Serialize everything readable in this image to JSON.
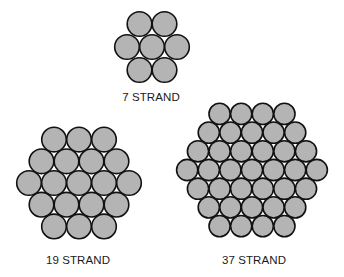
{
  "diagram": {
    "colors": {
      "strand_fill": "#b4b4b4",
      "strand_stroke": "#111111",
      "background": "#ffffff"
    },
    "bundles": [
      {
        "id": "7-strand",
        "label": "7 STRAND",
        "strand_count": 7,
        "rows": [
          2,
          3,
          2
        ],
        "center": [
          152,
          47
        ],
        "spacing": 25,
        "row_spacing": 23,
        "radius": 12.3,
        "label_pos": [
          151,
          97
        ]
      },
      {
        "id": "19-strand",
        "label": "19 STRAND",
        "strand_count": 19,
        "rows": [
          3,
          4,
          5,
          4,
          3
        ],
        "center": [
          79,
          183
        ],
        "spacing": 25,
        "row_spacing": 21.7,
        "radius": 12.3,
        "label_pos": [
          78,
          260
        ]
      },
      {
        "id": "37-strand",
        "label": "37 STRAND",
        "strand_count": 37,
        "rows": [
          4,
          5,
          6,
          7,
          6,
          5,
          4
        ],
        "center": [
          252,
          170
        ],
        "spacing": 21.6,
        "row_spacing": 18.7,
        "radius": 10.6,
        "label_pos": [
          254,
          260
        ]
      }
    ]
  }
}
